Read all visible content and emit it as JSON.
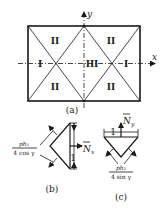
{
  "figure_a": {
    "caption": "(a)",
    "axis_x": "x",
    "axis_y": "y",
    "regions": {
      "left": "I",
      "right": "I",
      "center": "III",
      "top_left": "II",
      "top_right": "II",
      "bottom_left": "II",
      "bottom_right": "II"
    }
  },
  "figure_b": {
    "caption": "(b)",
    "load_numerator": "ph₁",
    "load_denominator": "4 cos γ",
    "force_label": "N̅x",
    "force_main": "N",
    "force_sub": "x",
    "unit_length": "1"
  },
  "figure_c": {
    "caption": "(c)",
    "load_numerator": "ph₂",
    "load_denominator": "4 sin γ",
    "force_main": "N",
    "force_sub": "y",
    "unit_length": "1"
  }
}
